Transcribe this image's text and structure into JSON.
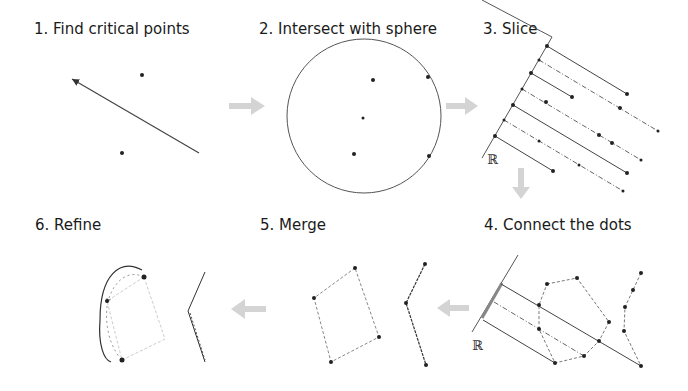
{
  "steps": [
    {
      "number": 1,
      "label": "1. Find critical points"
    },
    {
      "number": 2,
      "label": "2. Intersect with sphere"
    },
    {
      "number": 3,
      "label": "3. Slice"
    },
    {
      "number": 4,
      "label": "4. Connect the dots"
    },
    {
      "number": 5,
      "label": "5. Merge"
    },
    {
      "number": 6,
      "label": "6. Refine"
    }
  ],
  "axis_symbol": "ℝ",
  "colors": {
    "line": "#333333",
    "dot": "#222222",
    "dashed": "#888888",
    "light_dashed": "#bbbbbb",
    "arrow_fill": "#d0d0d0",
    "text": "#1a1a1a"
  }
}
